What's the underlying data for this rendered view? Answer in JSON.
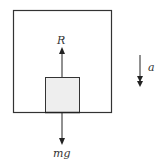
{
  "diagram": {
    "labels": {
      "normal_reaction": "R",
      "weight": "mg",
      "acceleration": "a"
    },
    "elements": {
      "outer_box": {
        "description": "lift / container",
        "stroke": "#333333"
      },
      "block": {
        "description": "mass on lift floor",
        "fill": "#eeeeee",
        "stroke": "#333333"
      },
      "force_up": {
        "label": "R",
        "direction": "up"
      },
      "force_down": {
        "label": "mg",
        "direction": "down"
      },
      "acceleration_arrow": {
        "label": "a",
        "direction": "down",
        "style": "double-headed"
      }
    },
    "colors": {
      "line": "#333333",
      "block_fill": "#eeeeee",
      "background": "#ffffff"
    }
  }
}
